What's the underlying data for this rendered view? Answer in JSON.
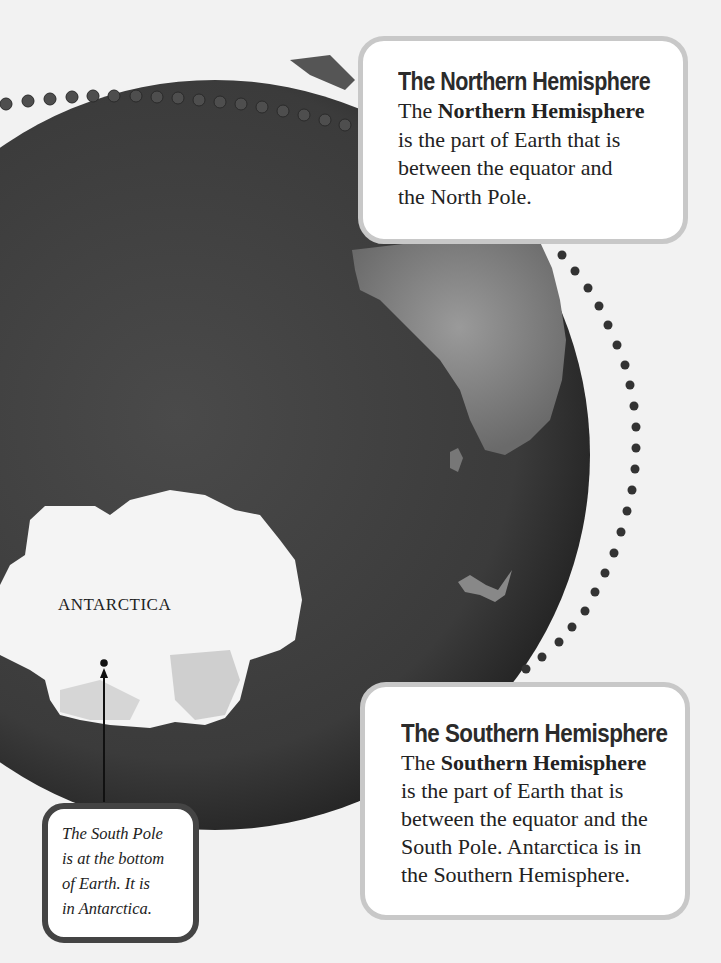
{
  "page": {
    "background_color": "#f2f2f2",
    "globe_color": "#3a3a3a"
  },
  "globe": {
    "continent_label": "ANTARCTICA",
    "features": [
      "earth-globe",
      "antarctica-landmass",
      "africa-landmass",
      "madagascar-island",
      "equator-dotted-line",
      "hemisphere-dotted-arc",
      "south-pole-marker"
    ]
  },
  "north_callout": {
    "title": "The Northern Hemisphere",
    "text_pre": "The ",
    "text_bold": "Northern Hemisphere",
    "line2": "is the part of Earth that is",
    "line3": "between the equator and",
    "line4": "the North Pole."
  },
  "south_callout": {
    "title": "The Southern Hemisphere",
    "text_pre": "The ",
    "text_bold": "Southern Hemisphere",
    "line2": "is the part of Earth that is",
    "line3": "between the equator and the",
    "line4": "South Pole. Antarctica is in",
    "line5": "the Southern Hemisphere."
  },
  "pole_callout": {
    "line1": "The South Pole",
    "line2": "is at the bottom",
    "line3": "of Earth. It is",
    "line4": "in Antarctica."
  }
}
